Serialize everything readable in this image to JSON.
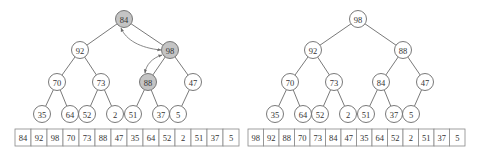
{
  "colors": {
    "highlight_fill": "#c4c4c4",
    "node_fill": "#ffffff",
    "stroke": "#6a6a6a"
  },
  "panels": [
    {
      "name": "before-swap",
      "nodes": [
        {
          "id": 0,
          "value": "84",
          "x": 124,
          "y": 19,
          "highlight": true
        },
        {
          "id": 1,
          "value": "92",
          "x": 80,
          "y": 50,
          "highlight": false
        },
        {
          "id": 2,
          "value": "98",
          "x": 170,
          "y": 50,
          "highlight": true
        },
        {
          "id": 3,
          "value": "70",
          "x": 57,
          "y": 82,
          "highlight": false
        },
        {
          "id": 4,
          "value": "73",
          "x": 101,
          "y": 82,
          "highlight": false
        },
        {
          "id": 5,
          "value": "88",
          "x": 148,
          "y": 82,
          "highlight": true
        },
        {
          "id": 6,
          "value": "47",
          "x": 193,
          "y": 82,
          "highlight": false
        },
        {
          "id": 7,
          "value": "35",
          "x": 42,
          "y": 114,
          "highlight": false
        },
        {
          "id": 8,
          "value": "64",
          "x": 70,
          "y": 114,
          "highlight": false
        },
        {
          "id": 9,
          "value": "52",
          "x": 87,
          "y": 114,
          "highlight": false
        },
        {
          "id": 10,
          "value": "2",
          "x": 115,
          "y": 114,
          "highlight": false
        },
        {
          "id": 11,
          "value": "51",
          "x": 133,
          "y": 114,
          "highlight": false
        },
        {
          "id": 12,
          "value": "37",
          "x": 161,
          "y": 114,
          "highlight": false
        },
        {
          "id": 13,
          "value": "5",
          "x": 178,
          "y": 114,
          "highlight": false
        }
      ],
      "swap_arrows": [
        {
          "from": "98",
          "to": "84",
          "bidirectional": true
        },
        {
          "from": "98",
          "to": "88",
          "bidirectional": true
        }
      ],
      "array": {
        "x": 15,
        "y": 129,
        "cell_width": 16,
        "cell_height": 17,
        "values": [
          "84",
          "92",
          "98",
          "70",
          "73",
          "88",
          "47",
          "35",
          "64",
          "52",
          "2",
          "51",
          "37",
          "5"
        ]
      }
    },
    {
      "name": "after-swap",
      "nodes": [
        {
          "id": 0,
          "value": "98",
          "x": 358,
          "y": 19,
          "highlight": false
        },
        {
          "id": 1,
          "value": "92",
          "x": 313,
          "y": 50,
          "highlight": false
        },
        {
          "id": 2,
          "value": "88",
          "x": 403,
          "y": 50,
          "highlight": false
        },
        {
          "id": 3,
          "value": "70",
          "x": 290,
          "y": 82,
          "highlight": false
        },
        {
          "id": 4,
          "value": "73",
          "x": 334,
          "y": 82,
          "highlight": false
        },
        {
          "id": 5,
          "value": "84",
          "x": 381,
          "y": 82,
          "highlight": false
        },
        {
          "id": 6,
          "value": "47",
          "x": 425,
          "y": 82,
          "highlight": false
        },
        {
          "id": 7,
          "value": "35",
          "x": 275,
          "y": 114,
          "highlight": false
        },
        {
          "id": 8,
          "value": "64",
          "x": 303,
          "y": 114,
          "highlight": false
        },
        {
          "id": 9,
          "value": "52",
          "x": 320,
          "y": 114,
          "highlight": false
        },
        {
          "id": 10,
          "value": "2",
          "x": 348,
          "y": 114,
          "highlight": false
        },
        {
          "id": 11,
          "value": "51",
          "x": 366,
          "y": 114,
          "highlight": false
        },
        {
          "id": 12,
          "value": "37",
          "x": 394,
          "y": 114,
          "highlight": false
        },
        {
          "id": 13,
          "value": "5",
          "x": 411,
          "y": 114,
          "highlight": false
        }
      ],
      "swap_arrows": [],
      "array": {
        "x": 248,
        "y": 129,
        "cell_width": 15.5,
        "cell_height": 17,
        "values": [
          "98",
          "92",
          "88",
          "70",
          "73",
          "84",
          "47",
          "35",
          "64",
          "52",
          "2",
          "51",
          "37",
          "5"
        ]
      }
    }
  ],
  "edges": [
    [
      0,
      1
    ],
    [
      0,
      2
    ],
    [
      1,
      3
    ],
    [
      1,
      4
    ],
    [
      2,
      5
    ],
    [
      2,
      6
    ],
    [
      3,
      7
    ],
    [
      3,
      8
    ],
    [
      4,
      9
    ],
    [
      4,
      10
    ],
    [
      5,
      11
    ],
    [
      5,
      12
    ],
    [
      6,
      13
    ]
  ]
}
